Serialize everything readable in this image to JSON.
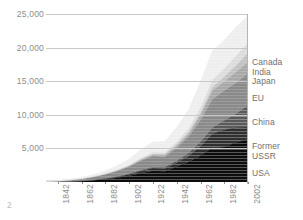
{
  "page": {
    "number": "2"
  },
  "chart_data": {
    "type": "area",
    "stacked": true,
    "title": "",
    "subtitle": "",
    "xlabel": "",
    "ylabel": "",
    "grid": true,
    "legend_position": "right-inline",
    "xlim": [
      1832,
      2002
    ],
    "ylim": [
      0,
      25000
    ],
    "yticks": [
      5000,
      10000,
      15000,
      20000,
      25000
    ],
    "ytick_labels": [
      "5,000",
      "10,000",
      "15,000",
      "20,000",
      "25,000"
    ],
    "xticks": [
      1842,
      1862,
      1882,
      1902,
      1922,
      1942,
      1962,
      1982,
      2002
    ],
    "xtick_labels": [
      "1842",
      "1862",
      "1882",
      "1902",
      "1922",
      "1942",
      "1962",
      "1982",
      "2002"
    ],
    "x": [
      1832,
      1842,
      1852,
      1862,
      1872,
      1882,
      1892,
      1902,
      1912,
      1922,
      1932,
      1942,
      1952,
      1962,
      1972,
      1982,
      1992,
      2002
    ],
    "series": [
      {
        "name": "USA",
        "color": "#0d0d0d",
        "values": [
          20,
          40,
          80,
          150,
          260,
          420,
          650,
          950,
          1350,
          1700,
          1600,
          2300,
          3000,
          3900,
          5100,
          5200,
          5900,
          6400
        ]
      },
      {
        "name": "Former USSR",
        "color": "#2f2f2f",
        "values": [
          5,
          10,
          18,
          30,
          50,
          80,
          130,
          200,
          300,
          380,
          420,
          600,
          900,
          1400,
          2100,
          2600,
          2200,
          1800
        ]
      },
      {
        "name": "China",
        "color": "#5a5a5a",
        "values": [
          5,
          8,
          12,
          20,
          30,
          45,
          70,
          100,
          150,
          200,
          230,
          300,
          450,
          700,
          950,
          1400,
          2100,
          3300
        ]
      },
      {
        "name": "EU",
        "color": "#8a8a8a",
        "values": [
          60,
          110,
          190,
          300,
          440,
          620,
          820,
          1050,
          1400,
          1600,
          1500,
          1900,
          2400,
          3200,
          4200,
          4400,
          4600,
          4700
        ]
      },
      {
        "name": "Japan",
        "color": "#a8a8a8",
        "values": [
          2,
          4,
          7,
          12,
          20,
          35,
          60,
          100,
          160,
          220,
          260,
          350,
          450,
          800,
          1300,
          1400,
          1600,
          1700
        ]
      },
      {
        "name": "India",
        "color": "#c2c2c2",
        "values": [
          2,
          3,
          5,
          9,
          15,
          25,
          40,
          60,
          90,
          120,
          150,
          200,
          260,
          360,
          520,
          700,
          1000,
          1400
        ]
      },
      {
        "name": "Canada",
        "color": "#dcdcdc",
        "values": [
          3,
          6,
          10,
          18,
          30,
          50,
          80,
          120,
          180,
          240,
          280,
          380,
          520,
          750,
          1050,
          1200,
          1400,
          1500
        ]
      },
      {
        "name": "Rest of world",
        "color": "#eeeeee",
        "values": [
          30,
          55,
          95,
          160,
          260,
          400,
          600,
          850,
          1200,
          1500,
          1600,
          2100,
          2800,
          3800,
          4300,
          4200,
          4300,
          3900
        ]
      }
    ],
    "legend_entries": [
      {
        "label": "Canada",
        "color": "#dcdcdc"
      },
      {
        "label": "India",
        "color": "#c2c2c2"
      },
      {
        "label": "Japan",
        "color": "#a8a8a8"
      },
      {
        "label": "EU",
        "color": "#8a8a8a"
      },
      {
        "label": "China",
        "color": "#5a5a5a"
      },
      {
        "label": "Former",
        "color": "#2f2f2f"
      },
      {
        "label": "USSR",
        "color": "#2f2f2f"
      },
      {
        "label": "USA",
        "color": "#0d0d0d"
      }
    ],
    "colors": {
      "grid": "#c9c9c9",
      "axis": "#b4b4b4",
      "tick_text": "#8d8d8d",
      "legend_text": "#6f6f6f",
      "background": "#ffffff"
    }
  }
}
